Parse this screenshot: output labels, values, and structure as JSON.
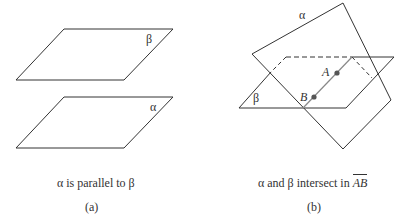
{
  "figure_a": {
    "planes": [
      {
        "label": "β",
        "points": [
          [
            16,
            80
          ],
          [
            64,
            29
          ],
          [
            173,
            29
          ],
          [
            124,
            80
          ]
        ]
      },
      {
        "label": "α",
        "points": [
          [
            16,
            148
          ],
          [
            64,
            97
          ],
          [
            173,
            97
          ],
          [
            124,
            148
          ]
        ]
      }
    ],
    "caption": "α is parallel to β",
    "sublabel": "(a)"
  },
  "figure_b": {
    "plane_alpha_label": "α",
    "plane_beta_label": "β",
    "point_a_label": "A",
    "point_b_label": "B",
    "caption_prefix": "α and β intersect in",
    "caption_line": "AB",
    "sublabel": "(b)"
  },
  "colors": {
    "stroke": "#333333",
    "line_ab": "#888888",
    "point": "#555555"
  }
}
